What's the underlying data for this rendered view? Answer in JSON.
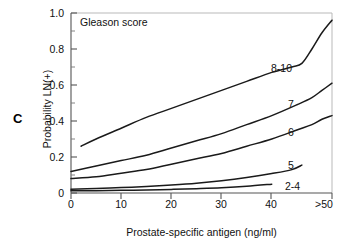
{
  "figure": {
    "panel_label": "C",
    "annotation": "Gleason score"
  },
  "axes": {
    "ylabel": "Probability LN(+)",
    "xlabel": "Prostate-specific antigen (ng/ml)",
    "yticks": [
      "0",
      "0.2",
      "0.4",
      "0.6",
      "0.8",
      "1.0"
    ],
    "xticks": [
      "0",
      "10",
      "20",
      "30",
      "40",
      ">50"
    ]
  },
  "curve_labels": {
    "g810": "8-10",
    "g7": "7",
    "g6": "6",
    "g5": "5",
    "g24": "2-4"
  },
  "chart_data": {
    "type": "line",
    "title": "",
    "subtitle": "",
    "annotation": "Gleason score",
    "panel": "C",
    "xlabel": "Prostate-specific antigen (ng/ml)",
    "ylabel": "Probability LN(+)",
    "xlim": [
      0,
      52
    ],
    "ylim": [
      0,
      1.0
    ],
    "xticks": [
      0,
      10,
      20,
      30,
      40,
      52
    ],
    "xtick_labels": [
      "0",
      "10",
      "20",
      "30",
      "40",
      ">50"
    ],
    "yticks": [
      0,
      0.2,
      0.4,
      0.6,
      0.8,
      1.0
    ],
    "ytick_labels": [
      "0",
      "0.2",
      "0.4",
      "0.6",
      "0.8",
      "1.0"
    ],
    "minor_ticks": true,
    "grid": false,
    "legend": "inline-curve-labels",
    "legend_position": "right-of-curves",
    "series": [
      {
        "name": "8-10",
        "x": [
          2,
          5,
          10,
          15,
          20,
          25,
          30,
          35,
          40,
          44,
          46,
          48,
          50,
          52
        ],
        "values": [
          0.26,
          0.3,
          0.36,
          0.42,
          0.47,
          0.52,
          0.57,
          0.62,
          0.67,
          0.7,
          0.72,
          0.8,
          0.89,
          0.96
        ]
      },
      {
        "name": "7",
        "x": [
          0,
          5,
          10,
          15,
          20,
          25,
          30,
          35,
          40,
          45,
          48,
          50,
          52
        ],
        "values": [
          0.12,
          0.15,
          0.18,
          0.21,
          0.25,
          0.29,
          0.33,
          0.38,
          0.43,
          0.49,
          0.53,
          0.57,
          0.61
        ]
      },
      {
        "name": "6",
        "x": [
          0,
          5,
          10,
          15,
          20,
          25,
          30,
          35,
          40,
          45,
          48,
          50,
          52
        ],
        "values": [
          0.08,
          0.09,
          0.11,
          0.13,
          0.16,
          0.19,
          0.22,
          0.26,
          0.3,
          0.35,
          0.38,
          0.41,
          0.43
        ]
      },
      {
        "name": "5",
        "x": [
          0,
          5,
          10,
          15,
          20,
          25,
          30,
          35,
          40,
          44,
          46
        ],
        "values": [
          0.021,
          0.025,
          0.03,
          0.036,
          0.044,
          0.054,
          0.068,
          0.086,
          0.108,
          0.13,
          0.155
        ]
      },
      {
        "name": "2-4",
        "x": [
          0,
          5,
          10,
          15,
          20,
          25,
          30,
          35,
          40
        ],
        "values": [
          0.012,
          0.013,
          0.015,
          0.017,
          0.02,
          0.024,
          0.029,
          0.037,
          0.049
        ]
      }
    ]
  }
}
